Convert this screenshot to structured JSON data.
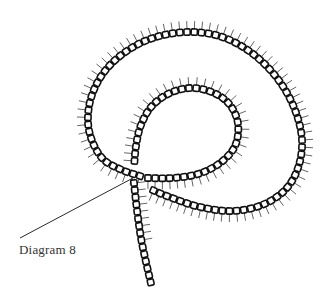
{
  "caption": "Diagram 8",
  "colors": {
    "background": "#ffffff",
    "stroke": "#111111",
    "bead_fill": "#ffffff",
    "fringe": "#222222",
    "text": "#333333"
  },
  "leader_line": {
    "x1": 20,
    "y1": 238,
    "x2": 133,
    "y2": 178
  },
  "bead": {
    "size": 6.2,
    "spacing": 7.2,
    "stroke_width": 1.6,
    "corner_radius": 1.2
  },
  "fringe": {
    "length": 8,
    "stroke_width": 0.7
  },
  "strands": [
    {
      "name": "outer-loop",
      "fringe_side": "left",
      "points": [
        [
          140,
          176
        ],
        [
          122,
          170
        ],
        [
          104,
          160
        ],
        [
          93,
          143
        ],
        [
          88,
          122
        ],
        [
          91,
          98
        ],
        [
          102,
          75
        ],
        [
          120,
          56
        ],
        [
          145,
          41
        ],
        [
          175,
          33
        ],
        [
          205,
          33
        ],
        [
          232,
          41
        ],
        [
          258,
          58
        ],
        [
          280,
          82
        ],
        [
          295,
          110
        ],
        [
          302,
          140
        ],
        [
          298,
          168
        ],
        [
          285,
          190
        ],
        [
          262,
          205
        ],
        [
          232,
          211
        ],
        [
          200,
          207
        ],
        [
          172,
          198
        ],
        [
          150,
          189
        ]
      ]
    },
    {
      "name": "inner-loop",
      "fringe_side": "right",
      "points": [
        [
          148,
          178
        ],
        [
          172,
          178
        ],
        [
          198,
          174
        ],
        [
          220,
          163
        ],
        [
          235,
          146
        ],
        [
          238,
          124
        ],
        [
          230,
          105
        ],
        [
          214,
          93
        ],
        [
          192,
          88
        ],
        [
          170,
          93
        ],
        [
          152,
          106
        ],
        [
          141,
          125
        ],
        [
          136,
          146
        ],
        [
          134,
          168
        ]
      ]
    },
    {
      "name": "tail",
      "fringe_side": "left",
      "points": [
        [
          134,
          183
        ],
        [
          137,
          210
        ],
        [
          141,
          238
        ],
        [
          146,
          262
        ],
        [
          152,
          288
        ]
      ],
      "fringe_until": 0.55
    }
  ]
}
